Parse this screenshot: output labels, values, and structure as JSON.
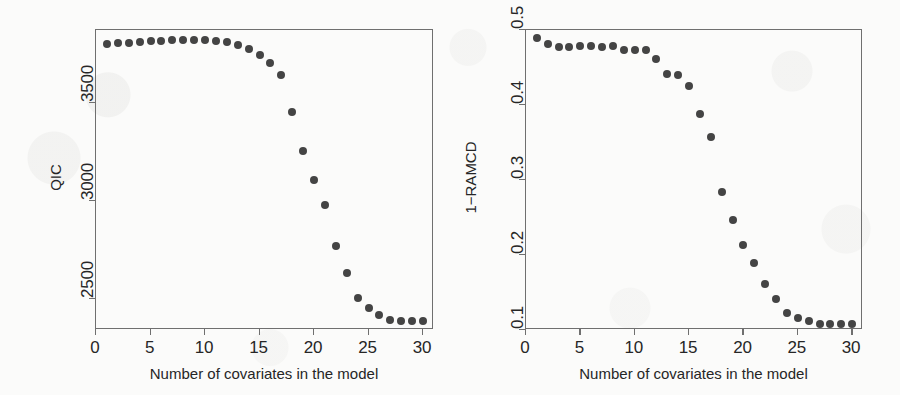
{
  "figure": {
    "background_color": "#fbfbfa",
    "point_color": "#444444",
    "axis_color": "#6f6f6f",
    "text_color": "#262626"
  },
  "panels": [
    {
      "id": "qic-panel",
      "ylabel": "QIC",
      "xlabel": "Number of covariates in the model",
      "x_ticks": [
        "0",
        "5",
        "10",
        "15",
        "20",
        "25",
        "30"
      ],
      "y_ticks": [
        "2500",
        "3000",
        "3500"
      ]
    },
    {
      "id": "ramcd-panel",
      "ylabel": "1−RAMCD",
      "xlabel": "Number of covariates in the model",
      "x_ticks": [
        "0",
        "5",
        "10",
        "15",
        "20",
        "25",
        "30"
      ],
      "y_ticks": [
        "0.1",
        "0.2",
        "0.3",
        "0.4",
        "0.5"
      ]
    }
  ],
  "chart_data": [
    {
      "type": "scatter",
      "title": "",
      "xlabel": "Number of covariates in the model",
      "ylabel": "QIC",
      "xlim": [
        0,
        31
      ],
      "ylim": [
        2340,
        3870
      ],
      "xticks": [
        0,
        5,
        10,
        15,
        20,
        25,
        30
      ],
      "yticks": [
        2500,
        3000,
        3500
      ],
      "grid": false,
      "legend": null,
      "marker": "filled-circle",
      "x": [
        1,
        2,
        3,
        4,
        5,
        6,
        7,
        8,
        9,
        10,
        11,
        12,
        13,
        14,
        15,
        16,
        17,
        18,
        19,
        20,
        21,
        22,
        23,
        24,
        25,
        26,
        27,
        28,
        29,
        30
      ],
      "y": [
        3800,
        3802,
        3805,
        3808,
        3812,
        3815,
        3818,
        3820,
        3820,
        3818,
        3815,
        3810,
        3795,
        3775,
        3745,
        3700,
        3640,
        3450,
        3255,
        3105,
        2975,
        2770,
        2630,
        2505,
        2450,
        2415,
        2390,
        2388,
        2386,
        2385
      ]
    },
    {
      "type": "scatter",
      "title": "",
      "xlabel": "Number of covariates in the model",
      "ylabel": "1−RAMCD",
      "xlim": [
        0,
        31
      ],
      "ylim": [
        0.1,
        0.5
      ],
      "xticks": [
        0,
        5,
        10,
        15,
        20,
        25,
        30
      ],
      "yticks": [
        0.1,
        0.2,
        0.3,
        0.4,
        0.5
      ],
      "grid": false,
      "legend": null,
      "marker": "filled-circle",
      "x": [
        1,
        2,
        3,
        4,
        5,
        6,
        7,
        8,
        9,
        10,
        11,
        12,
        13,
        14,
        15,
        16,
        17,
        18,
        19,
        20,
        21,
        22,
        23,
        24,
        25,
        26,
        27,
        28,
        29,
        30
      ],
      "y": [
        0.49,
        0.482,
        0.478,
        0.477,
        0.479,
        0.479,
        0.478,
        0.479,
        0.474,
        0.473,
        0.474,
        0.462,
        0.441,
        0.44,
        0.425,
        0.388,
        0.357,
        0.284,
        0.247,
        0.213,
        0.19,
        0.161,
        0.141,
        0.123,
        0.116,
        0.112,
        0.108,
        0.108,
        0.108,
        0.108
      ]
    }
  ]
}
